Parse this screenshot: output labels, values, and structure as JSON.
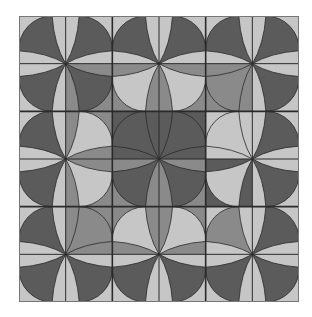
{
  "figure": {
    "grid": {
      "blocks": 3,
      "cells_per_side": 6
    },
    "colors": {
      "light": "#c6c6c6",
      "mid": "#8a8a8a",
      "dark": "#5b5b5b",
      "line": "#2a2a2a"
    },
    "cells": [
      [
        [
          "light",
          "dark"
        ],
        [
          "light",
          "dark"
        ],
        [
          "light",
          "dark"
        ],
        [
          "light",
          "dark"
        ],
        [
          "light",
          "dark"
        ],
        [
          "light",
          "dark"
        ]
      ],
      [
        [
          "light",
          "dark"
        ],
        [
          "mid",
          "dark"
        ],
        [
          "mid",
          "light"
        ],
        [
          "mid",
          "light"
        ],
        [
          "mid",
          "mid"
        ],
        [
          "light",
          "dark"
        ]
      ],
      [
        [
          "light",
          "dark"
        ],
        [
          "mid",
          "light"
        ],
        [
          "dark",
          "dark"
        ],
        [
          "dark",
          "dark"
        ],
        [
          "light",
          "light"
        ],
        [
          "light",
          "dark"
        ]
      ],
      [
        [
          "light",
          "dark"
        ],
        [
          "mid",
          "light"
        ],
        [
          "mid",
          "dark"
        ],
        [
          "mid",
          "dark"
        ],
        [
          "dark",
          "light"
        ],
        [
          "light",
          "dark"
        ]
      ],
      [
        [
          "light",
          "dark"
        ],
        [
          "mid",
          "mid"
        ],
        [
          "mid",
          "light"
        ],
        [
          "mid",
          "light"
        ],
        [
          "light",
          "mid"
        ],
        [
          "light",
          "dark"
        ]
      ],
      [
        [
          "light",
          "dark"
        ],
        [
          "light",
          "dark"
        ],
        [
          "light",
          "dark"
        ],
        [
          "light",
          "dark"
        ],
        [
          "light",
          "dark"
        ],
        [
          "light",
          "dark"
        ]
      ]
    ]
  }
}
